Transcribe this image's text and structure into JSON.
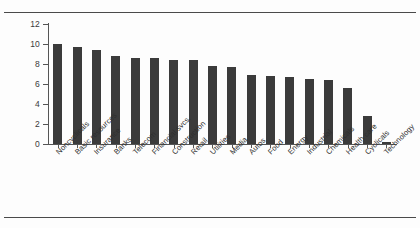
{
  "figure": {
    "background_color": "#fdfdfd",
    "bar_color": "#3b3b3b",
    "axis_color": "#555555",
    "rule_color": "#4a4a4a"
  },
  "axes": {
    "y_ticks": [
      "0",
      "2",
      "4",
      "6",
      "8",
      "10",
      "12"
    ],
    "y_tick_values": [
      0,
      2,
      4,
      6,
      8,
      10,
      12
    ]
  },
  "chart_data": {
    "type": "bar",
    "title": "",
    "subtitle": "",
    "xlabel": "",
    "ylabel": "",
    "ylim": [
      0,
      12
    ],
    "grid": false,
    "legend": null,
    "orientation": "vertical",
    "categories": [
      "Noncyclicals",
      "Basic resources",
      "Insurance",
      "Banks",
      "Telecom",
      "Financial svcs.",
      "Construction",
      "Retail",
      "Utilities",
      "Media",
      "Autos",
      "Food",
      "Energy",
      "Industrial",
      "Chemicals",
      "Health care",
      "Cyclicals",
      "Technology"
    ],
    "values": [
      10.0,
      9.7,
      9.4,
      8.8,
      8.65,
      8.65,
      8.45,
      8.45,
      7.8,
      7.75,
      6.95,
      6.85,
      6.7,
      6.5,
      6.4,
      5.6,
      2.8,
      0.2
    ],
    "y_tick_labels": [
      "0",
      "2",
      "4",
      "6",
      "8",
      "10",
      "12"
    ],
    "x_tick_labels": [
      "Noncyclicals",
      "Basic resources",
      "Insurance",
      "Banks",
      "Telecom",
      "Financial svcs.",
      "Construction",
      "Retail",
      "Utilities",
      "Media",
      "Autos",
      "Food",
      "Energy",
      "Industrial",
      "Chemicals",
      "Health care",
      "Cyclicals",
      "Technology"
    ]
  }
}
